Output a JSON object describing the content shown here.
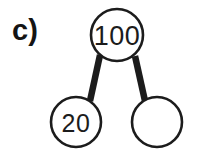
{
  "figure": {
    "part_label": "c)",
    "background_color": "#ffffff",
    "stroke_color": "#1c1c1c",
    "link_color": "#1c1c1c",
    "text_color": "#1c1c1c"
  },
  "chart_data": {
    "type": "diagram",
    "diagram_kind": "number-bond",
    "title": "c)",
    "whole": {
      "name": "whole-node",
      "value": "100",
      "filled": true,
      "cx": 117,
      "cy": 35,
      "r": 26
    },
    "parts": [
      {
        "name": "part-node-left",
        "value": "20",
        "filled": true,
        "cx": 76,
        "cy": 122,
        "r": 25
      },
      {
        "name": "part-node-right",
        "value": "",
        "filled": false,
        "cx": 157,
        "cy": 122,
        "r": 25
      }
    ],
    "links": [
      {
        "name": "link-whole-to-left-part",
        "x1": 100,
        "y1": 55,
        "x2": 90,
        "y2": 101
      },
      {
        "name": "link-whole-to-right-part",
        "x1": 135,
        "y1": 56,
        "x2": 145,
        "y2": 101
      }
    ],
    "stroke_width": 2.6,
    "link_width": 6.5
  }
}
